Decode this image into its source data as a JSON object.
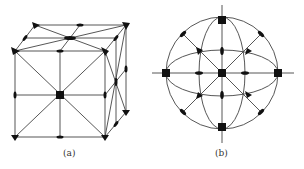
{
  "figure": {
    "panels": [
      {
        "id": "a",
        "label": "(a)",
        "subject": "cube symmetry elements"
      },
      {
        "id": "b",
        "label": "(b)",
        "subject": "stereographic projection of symmetry elements"
      }
    ],
    "legend_symbols": {
      "square": "4-fold axis",
      "triangle": "3-fold axis",
      "ellipse": "2-fold axis"
    },
    "colors": {
      "stroke": "#333333",
      "fill": "#111111",
      "background": "#ffffff"
    }
  }
}
